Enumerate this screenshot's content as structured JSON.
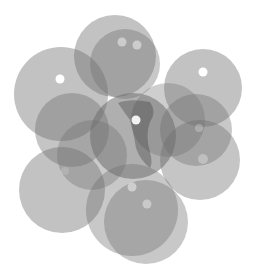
{
  "image": {
    "width": 255,
    "height": 274,
    "background": "#ffffff",
    "description": "Cluster of overlapping translucent gray circles with small white highlight dots"
  },
  "palette": {
    "circle_fill": "#6e6e6e",
    "highlight": "#ffffff",
    "dark_core": "#3a3a3a"
  },
  "circles": [
    {
      "id": "top-back",
      "cx": 115,
      "cy": 56,
      "r": 41,
      "opacity": 0.42
    },
    {
      "id": "top-front",
      "cx": 125,
      "cy": 64,
      "r": 35,
      "opacity": 0.38
    },
    {
      "id": "upper-left",
      "cx": 61,
      "cy": 94,
      "r": 47,
      "opacity": 0.42
    },
    {
      "id": "upper-right",
      "cx": 203,
      "cy": 88,
      "r": 39,
      "opacity": 0.42
    },
    {
      "id": "mid-left-a",
      "cx": 72,
      "cy": 130,
      "r": 37,
      "opacity": 0.4
    },
    {
      "id": "mid-left-b",
      "cx": 92,
      "cy": 155,
      "r": 35,
      "opacity": 0.36
    },
    {
      "id": "center-right-back",
      "cx": 168,
      "cy": 120,
      "r": 37,
      "opacity": 0.34
    },
    {
      "id": "right-mid",
      "cx": 196,
      "cy": 130,
      "r": 36,
      "opacity": 0.38
    },
    {
      "id": "right-lower",
      "cx": 200,
      "cy": 160,
      "r": 40,
      "opacity": 0.4
    },
    {
      "id": "lower-left",
      "cx": 62,
      "cy": 190,
      "r": 43,
      "opacity": 0.42
    },
    {
      "id": "lower-center-back",
      "cx": 132,
      "cy": 210,
      "r": 46,
      "opacity": 0.38
    },
    {
      "id": "lower-center-front",
      "cx": 146,
      "cy": 222,
      "r": 42,
      "opacity": 0.38
    },
    {
      "id": "center",
      "cx": 133,
      "cy": 136,
      "r": 43,
      "opacity": 0.55
    }
  ],
  "highlights": [
    {
      "id": "hl-top-1",
      "cx": 122,
      "cy": 42,
      "r": 4.5,
      "opacity": 0.45
    },
    {
      "id": "hl-top-2",
      "cx": 137,
      "cy": 45,
      "r": 4.5,
      "opacity": 0.45
    },
    {
      "id": "hl-upper-left",
      "cx": 60,
      "cy": 79,
      "r": 4.5,
      "opacity": 1.0
    },
    {
      "id": "hl-upper-right",
      "cx": 203,
      "cy": 72,
      "r": 4.5,
      "opacity": 1.0
    },
    {
      "id": "hl-center",
      "cx": 136,
      "cy": 120,
      "r": 4.5,
      "opacity": 0.9
    },
    {
      "id": "hl-right-mid",
      "cx": 199,
      "cy": 128,
      "r": 4,
      "opacity": 0.25
    },
    {
      "id": "hl-right-lower",
      "cx": 203,
      "cy": 159,
      "r": 5,
      "opacity": 0.3
    },
    {
      "id": "hl-left-faint",
      "cx": 65,
      "cy": 171,
      "r": 4,
      "opacity": 0.15
    },
    {
      "id": "hl-lower-1",
      "cx": 132,
      "cy": 187,
      "r": 4.5,
      "opacity": 0.45
    },
    {
      "id": "hl-lower-2",
      "cx": 147,
      "cy": 204,
      "r": 4.5,
      "opacity": 0.4
    }
  ],
  "dark_streak": {
    "path": "M118 103 Q130 98 150 102 Q157 112 150 122 Q145 135 150 152 Q153 163 150 168 Q140 160 136 148 Q133 130 130 120 Q124 112 118 103 Z",
    "opacity": 0.35
  }
}
